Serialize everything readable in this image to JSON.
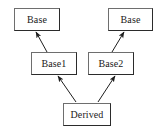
{
  "diagram": {
    "background_color": "#ffffff",
    "border_color": "#3a3a3a",
    "text_color": "#1a1a1a",
    "edge_color": "#222222",
    "nodes": [
      {
        "id": "base-left",
        "label": "Base",
        "x": 14,
        "y": 8,
        "width": 46,
        "height": 23
      },
      {
        "id": "base-right",
        "label": "Base",
        "x": 108,
        "y": 8,
        "width": 45,
        "height": 23
      },
      {
        "id": "base1",
        "label": "Base1",
        "x": 31,
        "y": 52,
        "width": 46,
        "height": 23
      },
      {
        "id": "base2",
        "label": "Base2",
        "x": 88,
        "y": 52,
        "width": 46,
        "height": 23
      },
      {
        "id": "derived",
        "label": "Derived",
        "x": 63,
        "y": 103,
        "width": 48,
        "height": 23
      }
    ],
    "edges": [
      {
        "id": "base1-to-base-left",
        "from": "base1",
        "to": "base-left",
        "arrow": "to",
        "x1": 47,
        "y1": 52,
        "x2": 36,
        "y2": 32
      },
      {
        "id": "base2-to-base-right",
        "from": "base2",
        "to": "base-right",
        "arrow": "to",
        "x1": 112,
        "y1": 52,
        "x2": 124,
        "y2": 32
      },
      {
        "id": "derived-to-base1",
        "from": "derived",
        "to": "base1",
        "arrow": "to",
        "x1": 76,
        "y1": 102,
        "x2": 58,
        "y2": 76
      },
      {
        "id": "derived-to-base2",
        "from": "derived",
        "to": "base2",
        "arrow": "to",
        "x1": 98,
        "y1": 102,
        "x2": 115,
        "y2": 76
      }
    ]
  }
}
